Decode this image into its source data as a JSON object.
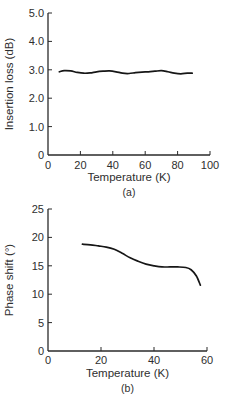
{
  "page": {
    "background": "#ffffff",
    "text_color": "#2e2e2e",
    "axis_color": "#2a2a2a",
    "line_color": "#161616"
  },
  "chart_data": [
    {
      "type": "line",
      "id": "a",
      "caption": "(a)",
      "title": "",
      "xlabel": "Temperature (K)",
      "ylabel": "Insertion loss (dB)",
      "xlim": [
        0,
        100
      ],
      "ylim": [
        0,
        5
      ],
      "grid": false,
      "legend": null,
      "xticks": {
        "values": [
          0,
          20,
          40,
          60,
          80,
          100
        ],
        "labels": [
          "0",
          "20",
          "40",
          "60",
          "80",
          "100"
        ]
      },
      "yticks": {
        "values": [
          0,
          1,
          2,
          3,
          4,
          5
        ],
        "labels": [
          "0",
          "1.0",
          "2.0",
          "3.0",
          "4.0",
          "5.0"
        ]
      },
      "series": [
        {
          "name": "insertion-loss",
          "x": [
            7,
            10,
            14,
            18,
            22,
            26,
            30,
            34,
            38,
            42,
            46,
            50,
            54,
            58,
            62,
            66,
            70,
            74,
            78,
            82,
            86,
            89
          ],
          "y": [
            2.93,
            2.97,
            2.96,
            2.91,
            2.88,
            2.89,
            2.93,
            2.95,
            2.96,
            2.93,
            2.88,
            2.87,
            2.9,
            2.92,
            2.93,
            2.95,
            2.97,
            2.93,
            2.88,
            2.86,
            2.88,
            2.88
          ]
        }
      ]
    },
    {
      "type": "line",
      "id": "b",
      "caption": "(b)",
      "title": "",
      "xlabel": "Temperature (K)",
      "ylabel": "Phase shift (°)",
      "xlim": [
        0,
        60
      ],
      "ylim": [
        0,
        25
      ],
      "grid": false,
      "legend": null,
      "xticks": {
        "values": [
          0,
          20,
          40,
          60
        ],
        "labels": [
          "0",
          "20",
          "40",
          "60"
        ]
      },
      "yticks": {
        "values": [
          0,
          5,
          10,
          15,
          20,
          25
        ],
        "labels": [
          "0",
          "5",
          "10",
          "15",
          "20",
          "25"
        ]
      },
      "series": [
        {
          "name": "phase-shift",
          "x": [
            13,
            16,
            19,
            22,
            25,
            28,
            31,
            34,
            37,
            40,
            43,
            46,
            49,
            52,
            54,
            56,
            57.5
          ],
          "y": [
            18.8,
            18.7,
            18.5,
            18.3,
            17.9,
            17.2,
            16.4,
            15.8,
            15.3,
            15.0,
            14.8,
            14.8,
            14.8,
            14.7,
            14.3,
            13.2,
            11.6
          ]
        }
      ]
    }
  ]
}
